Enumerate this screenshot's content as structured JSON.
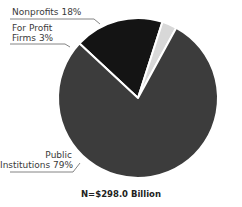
{
  "chart_data": {
    "type": "pie",
    "title": "",
    "slices": [
      {
        "label": "Nonprofits",
        "value": 18,
        "color": "#141414"
      },
      {
        "label": "For Profit Firms",
        "value": 3,
        "color": "#d8d8d8"
      },
      {
        "label": "Public Institutions",
        "value": 79,
        "color": "#3c3c3c"
      }
    ],
    "note": "N=$298.0 Billion"
  },
  "labels": {
    "nonprofits": "Nonprofits 18%",
    "forprofit_line1": "For Profit",
    "forprofit_line2": "Firms 3%",
    "public_line1": "Public",
    "public_line2": "Institutions 79%"
  },
  "footer": "N=$298.0 Billion"
}
